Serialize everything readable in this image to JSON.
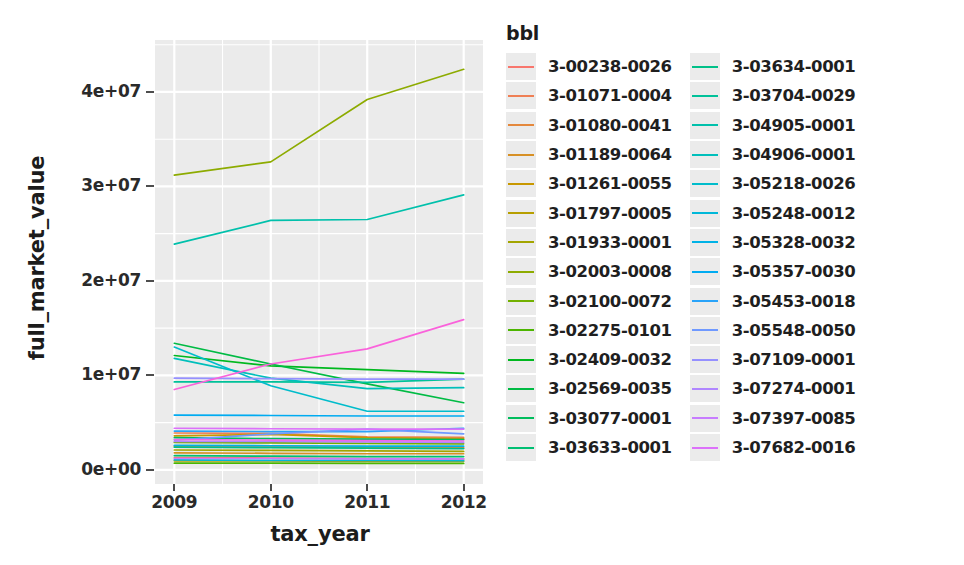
{
  "chart_data": {
    "type": "line",
    "title": "",
    "xlabel": "tax_year",
    "ylabel": "full_market_value",
    "legend_title": "bbl",
    "legend_position": "right",
    "grid": true,
    "x": [
      2009,
      2010,
      2011,
      2012
    ],
    "xtick_labels": [
      "2009",
      "2010",
      "2011",
      "2012"
    ],
    "xlim": [
      2008.8,
      2012.2
    ],
    "ytick_labels": [
      "0e+00",
      "1e+07",
      "2e+07",
      "3e+07",
      "4e+07"
    ],
    "ytick_values": [
      0,
      10000000,
      20000000,
      30000000,
      40000000
    ],
    "ylim": [
      -1500000,
      45500000
    ],
    "series": [
      {
        "name": "3-00238-0026",
        "color": "#f8766d",
        "values": [
          1300000,
          1250000,
          1200000,
          1150000
        ]
      },
      {
        "name": "3-01071-0004",
        "color": "#ef7f54",
        "values": [
          3900000,
          3850000,
          3500000,
          3450000
        ]
      },
      {
        "name": "3-01080-0041",
        "color": "#e4883c",
        "values": [
          2500000,
          2450000,
          2400000,
          2350000
        ]
      },
      {
        "name": "3-01189-0064",
        "color": "#d79025",
        "values": [
          1800000,
          1750000,
          1700000,
          1700000
        ]
      },
      {
        "name": "3-01261-0055",
        "color": "#c89800",
        "values": [
          3600000,
          3750000,
          3400000,
          3300000
        ]
      },
      {
        "name": "3-01797-0005",
        "color": "#b79f00",
        "values": [
          950000,
          950000,
          900000,
          900000
        ]
      },
      {
        "name": "3-01933-0001",
        "color": "#a3a500",
        "values": [
          2100000,
          2050000,
          2000000,
          1950000
        ]
      },
      {
        "name": "3-02003-0008",
        "color": "#8dab00",
        "values": [
          31200000,
          32600000,
          39200000,
          42400000
        ]
      },
      {
        "name": "3-02100-0072",
        "color": "#72b000",
        "values": [
          2900000,
          2850000,
          2800000,
          2750000
        ]
      },
      {
        "name": "3-02275-0101",
        "color": "#4cb500",
        "values": [
          700000,
          700000,
          680000,
          680000
        ]
      },
      {
        "name": "3-02409-0032",
        "color": "#00b81f",
        "values": [
          12100000,
          11000000,
          10600000,
          10200000
        ]
      },
      {
        "name": "3-02569-0035",
        "color": "#00bb44",
        "values": [
          13400000,
          11200000,
          9100000,
          7100000
        ]
      },
      {
        "name": "3-03077-0001",
        "color": "#00bd5d",
        "values": [
          3400000,
          3300000,
          3250000,
          3200000
        ]
      },
      {
        "name": "3-03633-0001",
        "color": "#00bf73",
        "values": [
          1500000,
          1450000,
          1400000,
          1400000
        ]
      },
      {
        "name": "3-03634-0001",
        "color": "#00c088",
        "values": [
          2400000,
          2350000,
          2300000,
          2250000
        ]
      },
      {
        "name": "3-03704-0029",
        "color": "#00c199",
        "values": [
          9300000,
          9300000,
          9250000,
          9600000
        ]
      },
      {
        "name": "3-04905-0001",
        "color": "#00c0ab",
        "values": [
          23900000,
          26400000,
          26500000,
          29100000
        ]
      },
      {
        "name": "3-04906-0001",
        "color": "#00bfbb",
        "values": [
          11800000,
          9700000,
          8600000,
          8700000
        ]
      },
      {
        "name": "3-05218-0026",
        "color": "#00bccb",
        "values": [
          13000000,
          8900000,
          6200000,
          6200000
        ]
      },
      {
        "name": "3-05248-0012",
        "color": "#00b8d9",
        "values": [
          1050000,
          1000000,
          1000000,
          980000
        ]
      },
      {
        "name": "3-05328-0032",
        "color": "#00b2e6",
        "values": [
          2600000,
          2550000,
          2500000,
          2500000
        ]
      },
      {
        "name": "3-05357-0030",
        "color": "#00abf1",
        "values": [
          5800000,
          5750000,
          5700000,
          5700000
        ]
      },
      {
        "name": "3-05453-0018",
        "color": "#29a3f9",
        "values": [
          4100000,
          4050000,
          4050000,
          4400000
        ]
      },
      {
        "name": "3-05548-0050",
        "color": "#6f99ff",
        "values": [
          3150000,
          3800000,
          4300000,
          3800000
        ]
      },
      {
        "name": "3-07109-0001",
        "color": "#9590ff",
        "values": [
          9700000,
          9650000,
          9600000,
          9600000
        ]
      },
      {
        "name": "3-07274-0001",
        "color": "#b086ff",
        "values": [
          3000000,
          3000000,
          2950000,
          2900000
        ]
      },
      {
        "name": "3-07397-0085",
        "color": "#c77cff",
        "values": [
          1200000,
          1200000,
          1150000,
          1150000
        ]
      },
      {
        "name": "3-07682-0016",
        "color": "#dc71fa",
        "values": [
          4400000,
          4350000,
          4300000,
          4300000
        ]
      },
      {
        "name": "3-05218-0026b",
        "color": "#ed6ae9",
        "values": [
          3200000,
          3150000,
          3100000,
          3050000
        ]
      },
      {
        "name": "3-07682-0016b",
        "color": "#fa62db",
        "values": [
          8500000,
          11200000,
          12800000,
          15900000
        ]
      }
    ]
  },
  "axes": {
    "y_title": "full_market_value",
    "x_title": "tax_year",
    "y_ticks": [
      "4e+07",
      "3e+07",
      "2e+07",
      "1e+07",
      "0e+00"
    ],
    "x_ticks": [
      "2009",
      "2010",
      "2011",
      "2012"
    ]
  },
  "legend": {
    "title": "bbl",
    "columns": [
      {
        "items": [
          {
            "label": "3-00238-0026",
            "color": "#f8766d"
          },
          {
            "label": "3-01071-0004",
            "color": "#ef7f54"
          },
          {
            "label": "3-01080-0041",
            "color": "#e4883c"
          },
          {
            "label": "3-01189-0064",
            "color": "#d79025"
          },
          {
            "label": "3-01261-0055",
            "color": "#c89800"
          },
          {
            "label": "3-01797-0005",
            "color": "#b79f00"
          },
          {
            "label": "3-01933-0001",
            "color": "#a3a500"
          },
          {
            "label": "3-02003-0008",
            "color": "#8dab00"
          },
          {
            "label": "3-02100-0072",
            "color": "#72b000"
          },
          {
            "label": "3-02275-0101",
            "color": "#4cb500"
          },
          {
            "label": "3-02409-0032",
            "color": "#00b81f"
          },
          {
            "label": "3-02569-0035",
            "color": "#00bb44"
          },
          {
            "label": "3-03077-0001",
            "color": "#00bd5d"
          },
          {
            "label": "3-03633-0001",
            "color": "#00bf73"
          }
        ]
      },
      {
        "items": [
          {
            "label": "3-03634-0001",
            "color": "#00c088"
          },
          {
            "label": "3-03704-0029",
            "color": "#00c199"
          },
          {
            "label": "3-04905-0001",
            "color": "#00c0ab"
          },
          {
            "label": "3-04906-0001",
            "color": "#00bfbb"
          },
          {
            "label": "3-05218-0026",
            "color": "#00bccb"
          },
          {
            "label": "3-05248-0012",
            "color": "#00b8d9"
          },
          {
            "label": "3-05328-0032",
            "color": "#00b2e6"
          },
          {
            "label": "3-05357-0030",
            "color": "#00abf1"
          },
          {
            "label": "3-05453-0018",
            "color": "#29a3f9"
          },
          {
            "label": "3-05548-0050",
            "color": "#6f99ff"
          },
          {
            "label": "3-07109-0001",
            "color": "#9590ff"
          },
          {
            "label": "3-07274-0001",
            "color": "#b086ff"
          },
          {
            "label": "3-07397-0085",
            "color": "#c77cff"
          },
          {
            "label": "3-07682-0016",
            "color": "#dc71fa"
          }
        ]
      }
    ]
  },
  "style": {
    "panel_background": "#ebebeb",
    "grid_color": "#ffffff",
    "text_color": "#1c1c1c"
  }
}
